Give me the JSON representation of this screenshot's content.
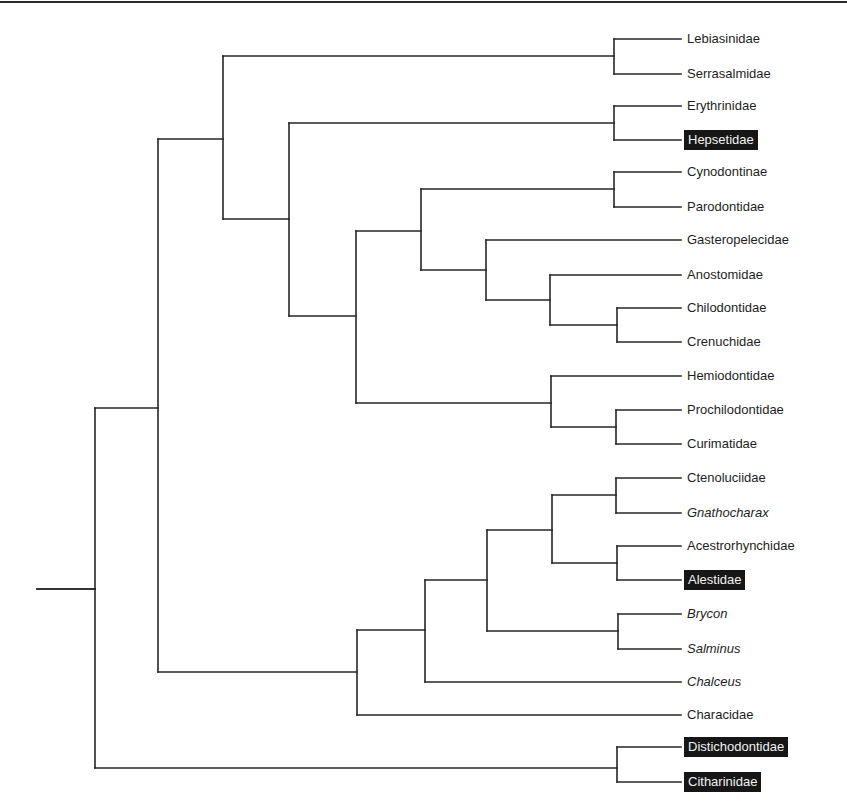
{
  "figure": {
    "type": "cladogram",
    "label_x": 687,
    "highlight_color": "#161616",
    "line_color": "#262626"
  },
  "leaves": [
    {
      "name": "Lebiasinidae",
      "y": 39,
      "x0": 614,
      "italic": false,
      "highlight": false
    },
    {
      "name": "Serrasalmidae",
      "y": 74,
      "x0": 614,
      "italic": false,
      "highlight": false
    },
    {
      "name": "Erythrinidae",
      "y": 106,
      "x0": 614,
      "italic": false,
      "highlight": false
    },
    {
      "name": "Hepsetidae",
      "y": 140,
      "x0": 614,
      "italic": false,
      "highlight": true
    },
    {
      "name": "Cynodontinae",
      "y": 172,
      "x0": 614,
      "italic": false,
      "highlight": false
    },
    {
      "name": "Parodontidae",
      "y": 207,
      "x0": 614,
      "italic": false,
      "highlight": false
    },
    {
      "name": "Gasteropelecidae",
      "y": 240,
      "x0": 486,
      "italic": false,
      "highlight": false
    },
    {
      "name": "Anostomidae",
      "y": 275,
      "x0": 550,
      "italic": false,
      "highlight": false
    },
    {
      "name": "Chilodontidae",
      "y": 308,
      "x0": 617,
      "italic": false,
      "highlight": false
    },
    {
      "name": "Crenuchidae",
      "y": 342,
      "x0": 617,
      "italic": false,
      "highlight": false
    },
    {
      "name": "Hemiodontidae",
      "y": 376,
      "x0": 551,
      "italic": false,
      "highlight": false
    },
    {
      "name": "Prochilodontidae",
      "y": 410,
      "x0": 616,
      "italic": false,
      "highlight": false
    },
    {
      "name": "Curimatidae",
      "y": 444,
      "x0": 616,
      "italic": false,
      "highlight": false
    },
    {
      "name": "Ctenoluciidae",
      "y": 478,
      "x0": 616,
      "italic": false,
      "highlight": false
    },
    {
      "name": "Gnathocharax",
      "y": 513,
      "x0": 616,
      "italic": true,
      "highlight": false
    },
    {
      "name": "Acestrorhynchidae",
      "y": 546,
      "x0": 617,
      "italic": false,
      "highlight": false
    },
    {
      "name": "Alestidae",
      "y": 580,
      "x0": 617,
      "italic": false,
      "highlight": true
    },
    {
      "name": "Brycon",
      "y": 614,
      "x0": 618,
      "italic": true,
      "highlight": false
    },
    {
      "name": "Salminus",
      "y": 649,
      "x0": 618,
      "italic": true,
      "highlight": false
    },
    {
      "name": "Chalceus",
      "y": 682,
      "x0": 425,
      "italic": true,
      "highlight": false
    },
    {
      "name": "Characidae",
      "y": 715,
      "x0": 357,
      "italic": false,
      "highlight": false
    },
    {
      "name": "Distichodontidae",
      "y": 747,
      "x0": 617,
      "italic": false,
      "highlight": true
    },
    {
      "name": "Citharinidae",
      "y": 782,
      "x0": 617,
      "italic": false,
      "highlight": true
    }
  ],
  "nodes": [
    {
      "id": "root-stub",
      "x": 95,
      "y_top": 589,
      "y_bottom": 589,
      "parent_x": 37,
      "join_y": 589
    },
    {
      "id": "root",
      "x": 95,
      "y_top": 408,
      "y_bottom": 768,
      "parent_x": 37,
      "join_y": 589
    },
    {
      "id": "A",
      "x": 158,
      "y_top": 139,
      "y_bottom": 672,
      "parent_x": 95,
      "join_y": 408
    },
    {
      "id": "B",
      "x": 223,
      "y_top": 56,
      "y_bottom": 219,
      "parent_x": 158,
      "join_y": 139
    },
    {
      "id": "leb-serr",
      "x": 614,
      "y_top": 39,
      "y_bottom": 74,
      "parent_x": 223,
      "join_y": 56
    },
    {
      "id": "C",
      "x": 289,
      "y_top": 123,
      "y_bottom": 316,
      "parent_x": 223,
      "join_y": 219
    },
    {
      "id": "ery-hep",
      "x": 614,
      "y_top": 106,
      "y_bottom": 140,
      "parent_x": 289,
      "join_y": 123
    },
    {
      "id": "D",
      "x": 356,
      "y_top": 231,
      "y_bottom": 403,
      "parent_x": 289,
      "join_y": 316
    },
    {
      "id": "E",
      "x": 421,
      "y_top": 189,
      "y_bottom": 270,
      "parent_x": 356,
      "join_y": 231
    },
    {
      "id": "cyn-par",
      "x": 614,
      "y_top": 172,
      "y_bottom": 207,
      "parent_x": 421,
      "join_y": 189
    },
    {
      "id": "F",
      "x": 486,
      "y_top": 240,
      "y_bottom": 300,
      "parent_x": 421,
      "join_y": 270
    },
    {
      "id": "G",
      "x": 550,
      "y_top": 275,
      "y_bottom": 325,
      "parent_x": 486,
      "join_y": 300
    },
    {
      "id": "chil-cren",
      "x": 617,
      "y_top": 308,
      "y_bottom": 342,
      "parent_x": 550,
      "join_y": 325
    },
    {
      "id": "H",
      "x": 551,
      "y_top": 376,
      "y_bottom": 427,
      "parent_x": 356,
      "join_y": 403
    },
    {
      "id": "proc-cur",
      "x": 616,
      "y_top": 410,
      "y_bottom": 444,
      "parent_x": 551,
      "join_y": 427
    },
    {
      "id": "I",
      "x": 357,
      "y_top": 630,
      "y_bottom": 715,
      "parent_x": 158,
      "join_y": 672
    },
    {
      "id": "J",
      "x": 425,
      "y_top": 580,
      "y_bottom": 682,
      "parent_x": 357,
      "join_y": 630
    },
    {
      "id": "K",
      "x": 487,
      "y_top": 530,
      "y_bottom": 631,
      "parent_x": 425,
      "join_y": 580
    },
    {
      "id": "L",
      "x": 552,
      "y_top": 495,
      "y_bottom": 563,
      "parent_x": 487,
      "join_y": 530
    },
    {
      "id": "cten-gnath",
      "x": 616,
      "y_top": 478,
      "y_bottom": 513,
      "parent_x": 552,
      "join_y": 495
    },
    {
      "id": "acest-ales",
      "x": 617,
      "y_top": 546,
      "y_bottom": 580,
      "parent_x": 552,
      "join_y": 563
    },
    {
      "id": "bry-sal",
      "x": 618,
      "y_top": 614,
      "y_bottom": 649,
      "parent_x": 487,
      "join_y": 631
    },
    {
      "id": "dist-cith",
      "x": 617,
      "y_top": 747,
      "y_bottom": 782,
      "parent_x": 95,
      "join_y": 768
    }
  ],
  "leaf_line_end_x": 681
}
